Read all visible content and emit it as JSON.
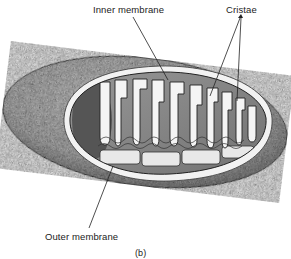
{
  "figure": {
    "panel_label": "(b)",
    "labels": {
      "inner_membrane": "Inner membrane",
      "cristae": "Cristae",
      "outer_membrane": "Outer membrane"
    },
    "colors": {
      "background": "#ffffff",
      "ink": "#222222",
      "stipple_dark": "#8a8a8a",
      "stipple_light": "#d6d6d6",
      "matrix": "#b0b0b0"
    }
  }
}
